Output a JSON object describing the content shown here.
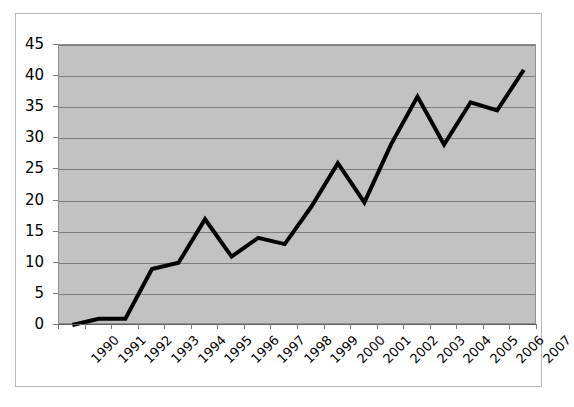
{
  "chart_data": {
    "type": "line",
    "title": "",
    "subtitle": "",
    "xlabel": "",
    "ylabel": "",
    "categories": [
      "1990",
      "1991",
      "1992",
      "1993",
      "1994",
      "1995",
      "1996",
      "1997",
      "1998",
      "1999",
      "2000",
      "2001",
      "2002",
      "2003",
      "2004",
      "2005",
      "2006",
      "2007"
    ],
    "values": [
      0,
      1,
      1,
      9,
      10,
      17,
      11,
      14,
      13,
      19,
      26,
      19.7,
      29,
      36.7,
      29,
      35.8,
      34.5,
      41
    ],
    "series": [
      {
        "name": "",
        "values": [
          0,
          1,
          1,
          9,
          10,
          17,
          11,
          14,
          13,
          19,
          26,
          19.7,
          29,
          36.7,
          29,
          35.8,
          34.5,
          41
        ]
      }
    ],
    "ylim": [
      0,
      45
    ],
    "ytick_values": [
      0,
      5,
      10,
      15,
      20,
      25,
      30,
      35,
      40,
      45
    ],
    "ytick_labels": [
      "0",
      "5",
      "10",
      "15",
      "20",
      "25",
      "30",
      "35",
      "40",
      "45"
    ],
    "grid": true,
    "grid_axis": "y",
    "legend": false,
    "legend_position": "none",
    "xtick_rotation": -45,
    "colors": {
      "line": "#000000",
      "plot_background": "#c2c2c2",
      "gridline": "#7d7d7d",
      "plot_border": "#8f8f8f",
      "chart_border": "#b9b9b9",
      "page_background": "#ffffff",
      "tick_label": "#000000"
    },
    "line_width": 4
  }
}
